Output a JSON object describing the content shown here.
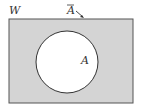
{
  "diagram": {
    "type": "venn",
    "universe_label": "W",
    "set_label": "A",
    "complement_label": "A̅",
    "complement_label_base": "A",
    "colors": {
      "shaded": "#d4d4d4",
      "circle_fill": "#ffffff",
      "stroke": "#444444"
    }
  }
}
